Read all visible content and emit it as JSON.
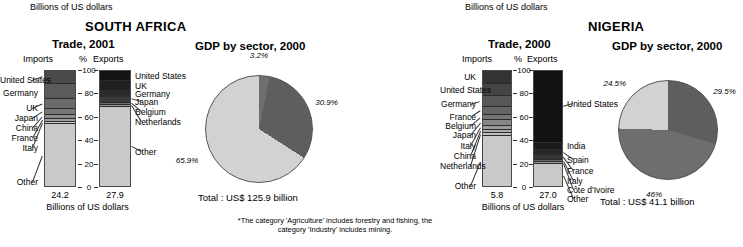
{
  "figure": {
    "footnote": "*The category 'Agriculture' includes forestry and fishing, the category 'Industry' includes mining."
  },
  "south_africa": {
    "country": "SOUTH AFRICA",
    "top_note": "Billions of US dollars",
    "trade": {
      "title": "Trade, 2001",
      "header_imports": "Imports",
      "header_pct": "%",
      "header_exports": "Exports",
      "axis_ticks": [
        "100",
        "80",
        "60",
        "40",
        "20",
        "0"
      ],
      "imports_total": "24.2",
      "exports_total": "27.9",
      "unit_caption": "Billions of US dollars",
      "imports": {
        "labels": [
          "United States",
          "Germany",
          "UK",
          "Japan",
          "China",
          "France",
          "Italy",
          "Other"
        ],
        "segments": [
          {
            "label": "United States",
            "value": 11.0,
            "color": "#4a4a4a"
          },
          {
            "label": "Germany",
            "value": 13.5,
            "color": "#5b5b5b"
          },
          {
            "label": "UK",
            "value": 8.5,
            "color": "#6b6b6b"
          },
          {
            "label": "Japan",
            "value": 5.0,
            "color": "#787878"
          },
          {
            "label": "China",
            "value": 3.5,
            "color": "#8c8c8c"
          },
          {
            "label": "France",
            "value": 2.5,
            "color": "#a0a0a0"
          },
          {
            "label": "Italy",
            "value": 2.0,
            "color": "#cfcfcf"
          },
          {
            "label": "Other",
            "value": 54.0,
            "color": "#c9c9c9"
          }
        ]
      },
      "exports": {
        "labels": [
          "United States",
          "UK",
          "Germany",
          "Japan",
          "Belgium",
          "Netherlands",
          "Other"
        ],
        "segments": [
          {
            "label": "United States",
            "value": 9.0,
            "color": "#141414"
          },
          {
            "label": "UK",
            "value": 8.0,
            "color": "#202020"
          },
          {
            "label": "Germany",
            "value": 5.5,
            "color": "#2c2c2c"
          },
          {
            "label": "Japan",
            "value": 5.0,
            "color": "#3a3a3a"
          },
          {
            "label": "Belgium",
            "value": 2.0,
            "color": "#6e6e6e"
          },
          {
            "label": "Netherlands",
            "value": 1.5,
            "color": "#9a9a9a"
          },
          {
            "label": "Other",
            "value": 69.0,
            "color": "#c9c9c9"
          }
        ]
      }
    },
    "gdp": {
      "title": "GDP by sector, 2000",
      "total": "Total : US$ 125.9 billion",
      "slices": [
        {
          "label": "3.2%",
          "value": 3.2,
          "color": "#6e6e6e"
        },
        {
          "label": "30.9%",
          "value": 30.9,
          "color": "#5e5e5e"
        },
        {
          "label": "65.9%",
          "value": 65.9,
          "color": "#d2d2d2"
        }
      ]
    }
  },
  "nigeria": {
    "country": "NIGERIA",
    "top_note": "Billions of US dollars",
    "trade": {
      "title": "Trade, 2000",
      "header_imports": "Imports",
      "header_pct": "%",
      "header_exports": "Exports",
      "axis_ticks": [
        "100",
        "80",
        "60",
        "40",
        "20",
        "0"
      ],
      "imports_total": "5.8",
      "exports_total": "27.0",
      "unit_caption": "Billions of US dollars",
      "imports": {
        "labels": [
          "UK",
          "United States",
          "Germany",
          "France",
          "Belgium",
          "Japan",
          "Italy",
          "China",
          "Netherlands",
          "Other"
        ],
        "segments": [
          {
            "label": "UK",
            "value": 11.0,
            "color": "#333333"
          },
          {
            "label": "United States",
            "value": 11.0,
            "color": "#454545"
          },
          {
            "label": "Germany",
            "value": 9.0,
            "color": "#585858"
          },
          {
            "label": "France",
            "value": 7.0,
            "color": "#656565"
          },
          {
            "label": "Belgium",
            "value": 5.0,
            "color": "#757575"
          },
          {
            "label": "Japan",
            "value": 4.5,
            "color": "#878787"
          },
          {
            "label": "Italy",
            "value": 3.5,
            "color": "#9a9a9a"
          },
          {
            "label": "China",
            "value": 3.0,
            "color": "#adadad"
          },
          {
            "label": "Netherlands",
            "value": 2.5,
            "color": "#c0c0c0"
          },
          {
            "label": "Other",
            "value": 43.5,
            "color": "#c9c9c9"
          }
        ]
      },
      "exports": {
        "labels": [
          "United States",
          "India",
          "Spain",
          "France",
          "Italy",
          "Côte d'Ivoire",
          "Other"
        ],
        "segments": [
          {
            "label": "United States",
            "value": 63.0,
            "color": "#111111"
          },
          {
            "label": "India",
            "value": 5.5,
            "color": "#1c1c1c"
          },
          {
            "label": "Spain",
            "value": 4.5,
            "color": "#262626"
          },
          {
            "label": "France",
            "value": 4.0,
            "color": "#343434"
          },
          {
            "label": "Italy",
            "value": 2.0,
            "color": "#6a6a6a"
          },
          {
            "label": "Côte d'Ivoire",
            "value": 2.0,
            "color": "#9c9c9c"
          },
          {
            "label": "Other",
            "value": 19.0,
            "color": "#c9c9c9"
          }
        ]
      }
    },
    "gdp": {
      "title": "GDP by sector, 2000",
      "total": "Total : US$ 41.1 billion",
      "slices": [
        {
          "label": "29.5%",
          "value": 29.5,
          "color": "#5e5e5e"
        },
        {
          "label": "46%",
          "value": 46.0,
          "color": "#6e6e6e"
        },
        {
          "label": "24.5%",
          "value": 24.5,
          "color": "#d2d2d2"
        }
      ]
    }
  },
  "chart_data": [
    {
      "type": "bar",
      "title": "South Africa Trade, 2001 — Imports (share of total, %)",
      "xlabel": "Imports",
      "ylabel": "%",
      "ylim": [
        0,
        100
      ],
      "categories": [
        "United States",
        "Germany",
        "UK",
        "Japan",
        "China",
        "France",
        "Italy",
        "Other"
      ],
      "values": [
        11.0,
        13.5,
        8.5,
        5.0,
        3.5,
        2.5,
        2.0,
        54.0
      ],
      "total_label": "24.2",
      "unit": "Billions of US dollars"
    },
    {
      "type": "bar",
      "title": "South Africa Trade, 2001 — Exports (share of total, %)",
      "xlabel": "Exports",
      "ylabel": "%",
      "ylim": [
        0,
        100
      ],
      "categories": [
        "United States",
        "UK",
        "Germany",
        "Japan",
        "Belgium",
        "Netherlands",
        "Other"
      ],
      "values": [
        9.0,
        8.0,
        5.5,
        5.0,
        2.0,
        1.5,
        69.0
      ],
      "total_label": "27.9",
      "unit": "Billions of US dollars"
    },
    {
      "type": "pie",
      "title": "South Africa GDP by sector, 2000",
      "categories": [
        "Agriculture",
        "Industry",
        "Services"
      ],
      "values": [
        3.2,
        30.9,
        65.9
      ],
      "labels": [
        "3.2%",
        "30.9%",
        "65.9%"
      ],
      "total": "Total : US$ 125.9 billion"
    },
    {
      "type": "bar",
      "title": "Nigeria Trade, 2000 — Imports (share of total, %)",
      "xlabel": "Imports",
      "ylabel": "%",
      "ylim": [
        0,
        100
      ],
      "categories": [
        "UK",
        "United States",
        "Germany",
        "France",
        "Belgium",
        "Japan",
        "Italy",
        "China",
        "Netherlands",
        "Other"
      ],
      "values": [
        11.0,
        11.0,
        9.0,
        7.0,
        5.0,
        4.5,
        3.5,
        3.0,
        2.5,
        43.5
      ],
      "total_label": "5.8",
      "unit": "Billions of US dollars"
    },
    {
      "type": "bar",
      "title": "Nigeria Trade, 2000 — Exports (share of total, %)",
      "xlabel": "Exports",
      "ylabel": "%",
      "ylim": [
        0,
        100
      ],
      "categories": [
        "United States",
        "India",
        "Spain",
        "France",
        "Italy",
        "Côte d'Ivoire",
        "Other"
      ],
      "values": [
        63.0,
        5.5,
        4.5,
        4.0,
        2.0,
        2.0,
        19.0
      ],
      "total_label": "27.0",
      "unit": "Billions of US dollars"
    },
    {
      "type": "pie",
      "title": "Nigeria GDP by sector, 2000",
      "categories": [
        "Agriculture",
        "Industry",
        "Services"
      ],
      "values": [
        29.5,
        46.0,
        24.5
      ],
      "labels": [
        "29.5%",
        "46%",
        "24.5%"
      ],
      "total": "Total : US$ 41.1 billion"
    }
  ]
}
